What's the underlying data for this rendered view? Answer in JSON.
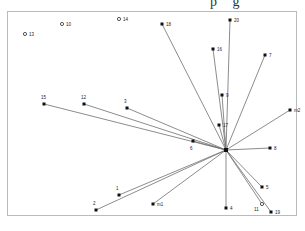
{
  "diagram": {
    "type": "star-network",
    "top_cut_text": "p g",
    "hub": {
      "id": "hub",
      "x": 226,
      "y": 150
    },
    "nodes": [
      {
        "id": "13",
        "label": "13",
        "x": 25,
        "y": 34,
        "connected": false,
        "hollow": true
      },
      {
        "id": "10",
        "label": "10",
        "x": 62,
        "y": 24,
        "connected": false,
        "hollow": true
      },
      {
        "id": "14",
        "label": "14",
        "x": 119,
        "y": 19,
        "connected": false,
        "hollow": true
      },
      {
        "id": "18",
        "label": "18",
        "x": 162,
        "y": 24,
        "connected": true
      },
      {
        "id": "20",
        "label": "20",
        "x": 230,
        "y": 20,
        "connected": true
      },
      {
        "id": "16",
        "label": "16",
        "x": 213,
        "y": 49,
        "connected": true
      },
      {
        "id": "7",
        "label": "7",
        "x": 265,
        "y": 55,
        "connected": true
      },
      {
        "id": "9",
        "label": "9",
        "x": 222,
        "y": 95,
        "connected": true
      },
      {
        "id": "m2",
        "label": "m2",
        "x": 290,
        "y": 110,
        "connected": true
      },
      {
        "id": "15",
        "label": "15",
        "x": 44,
        "y": 104,
        "connected": true
      },
      {
        "id": "12",
        "label": "12",
        "x": 84,
        "y": 104,
        "connected": true
      },
      {
        "id": "3",
        "label": "3",
        "x": 127,
        "y": 108,
        "connected": true
      },
      {
        "id": "17",
        "label": "17",
        "x": 219,
        "y": 125,
        "connected": true
      },
      {
        "id": "6",
        "label": "6",
        "x": 193,
        "y": 141,
        "connected": true,
        "label_dx": -3,
        "label_dy": 9
      },
      {
        "id": "8",
        "label": "8",
        "x": 270,
        "y": 148,
        "connected": true
      },
      {
        "id": "5",
        "label": "5",
        "x": 262,
        "y": 187,
        "connected": true
      },
      {
        "id": "1",
        "label": "1",
        "x": 119,
        "y": 195,
        "connected": true
      },
      {
        "id": "2",
        "label": "2",
        "x": 96,
        "y": 210,
        "connected": true
      },
      {
        "id": "m1",
        "label": "m1",
        "x": 153,
        "y": 204,
        "connected": true
      },
      {
        "id": "4",
        "label": "4",
        "x": 226,
        "y": 208,
        "connected": true
      },
      {
        "id": "11",
        "label": "11",
        "x": 262,
        "y": 204,
        "connected": true,
        "hollow": true,
        "label_dx": -8,
        "label_dy": 7
      },
      {
        "id": "19",
        "label": "19",
        "x": 271,
        "y": 212,
        "connected": true
      }
    ]
  }
}
